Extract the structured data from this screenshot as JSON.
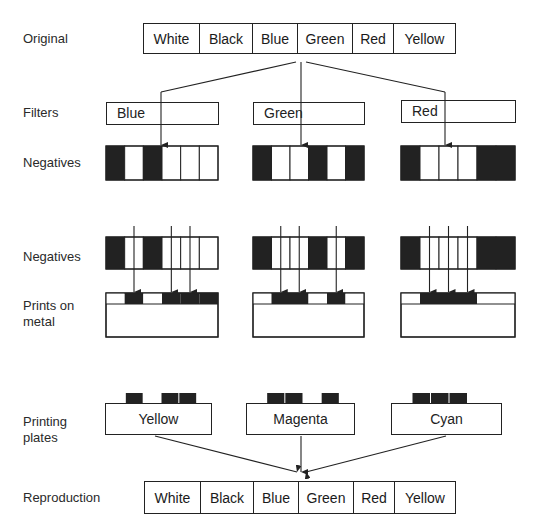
{
  "row_labels": {
    "original": "Original",
    "filters": "Filters",
    "negatives_1": "Negatives",
    "negatives_2": "Negatives",
    "prints_line1": "Prints on",
    "prints_line2": "metal",
    "plates_line1": "Printing",
    "plates_line2": "plates",
    "reproduction": "Reproduction"
  },
  "original": {
    "cells": [
      "White",
      "Black",
      "Blue",
      "Green",
      "Red",
      "Yellow"
    ]
  },
  "filters": [
    {
      "label": "Blue"
    },
    {
      "label": "Green"
    },
    {
      "label": "Red"
    }
  ],
  "negatives": [
    {
      "filter": "Blue",
      "pattern": [
        "black",
        "white",
        "black",
        "white",
        "white",
        "white"
      ]
    },
    {
      "filter": "Green",
      "pattern": [
        "black",
        "white",
        "white",
        "black",
        "white",
        "black"
      ]
    },
    {
      "filter": "Red",
      "pattern": [
        "black",
        "white",
        "white",
        "white",
        "black",
        "black"
      ]
    }
  ],
  "plates": [
    {
      "label": "Yellow"
    },
    {
      "label": "Magenta"
    },
    {
      "label": "Cyan"
    }
  ],
  "reproduction": {
    "cells": [
      "White",
      "Black",
      "Blue",
      "Green",
      "Red",
      "Yellow"
    ]
  },
  "colors": {
    "ink": "#222222",
    "background": "#ffffff"
  }
}
